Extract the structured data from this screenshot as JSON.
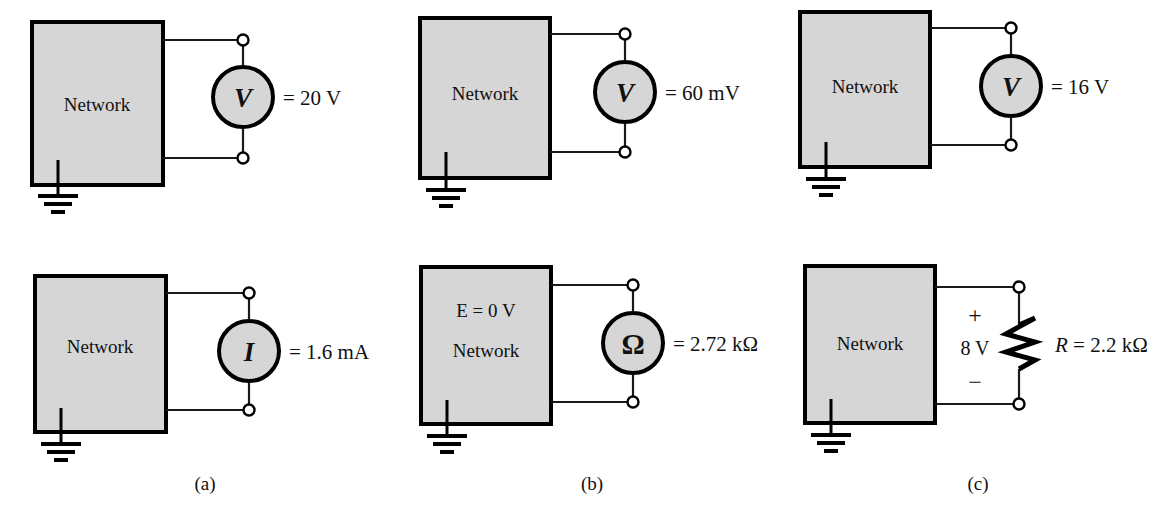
{
  "figure": {
    "background_color": "#ffffff",
    "box_fill_color": "#d6d6d6",
    "line_color": "#000000",
    "network_label": "Network",
    "ground_icon": "ground-icon"
  },
  "panels": [
    {
      "id": "panel-a-top",
      "caption": "",
      "network_label": "Network",
      "box_note": "",
      "meter_symbol": "V",
      "meter_kind": "voltmeter",
      "value_text": "= 20 V",
      "has_resistor": false
    },
    {
      "id": "panel-b-top",
      "caption": "",
      "network_label": "Network",
      "box_note": "",
      "meter_symbol": "V",
      "meter_kind": "voltmeter",
      "value_text": "= 60 mV",
      "has_resistor": false
    },
    {
      "id": "panel-c-top",
      "caption": "",
      "network_label": "Network",
      "box_note": "",
      "meter_symbol": "V",
      "meter_kind": "voltmeter",
      "value_text": "= 16 V",
      "has_resistor": false
    },
    {
      "id": "panel-a-bottom",
      "caption": "(a)",
      "network_label": "Network",
      "box_note": "",
      "meter_symbol": "I",
      "meter_kind": "ammeter",
      "value_text": "= 1.6 mA",
      "has_resistor": false
    },
    {
      "id": "panel-b-bottom",
      "caption": "(b)",
      "network_label": "Network",
      "box_note": "E = 0 V",
      "meter_symbol": "Ω",
      "meter_kind": "ohmmeter",
      "value_text": "= 2.72 kΩ",
      "has_resistor": false
    },
    {
      "id": "panel-c-bottom",
      "caption": "(c)",
      "network_label": "Network",
      "box_note": "",
      "meter_symbol": "",
      "meter_kind": "resistor",
      "value_label": "R",
      "value_text": "= 2.2 kΩ",
      "polarity_plus": "+",
      "polarity_minus": "−",
      "drop_text": "8 V",
      "has_resistor": true
    }
  ],
  "captions": {
    "a": "(a)",
    "b": "(b)",
    "c": "(c)"
  }
}
